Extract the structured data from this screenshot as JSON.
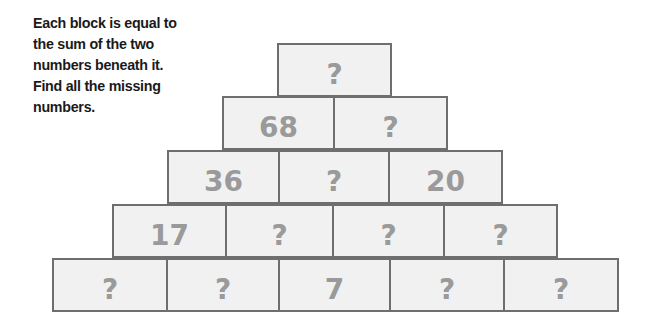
{
  "instructions": "Each block is equal to the sum of the two numbers beneath it. Find all the missing numbers.",
  "pyramid": {
    "rows": [
      [
        "?"
      ],
      [
        "68",
        "?"
      ],
      [
        "36",
        "?",
        "20"
      ],
      [
        "17",
        "?",
        "?",
        "?"
      ],
      [
        "?",
        "?",
        "7",
        "?",
        "?"
      ]
    ]
  },
  "colors": {
    "block_fill": "#f1f1f1",
    "block_border": "#6e6e6e",
    "number_text": "#9a9a9a",
    "instruction_text": "#1a1a1a"
  }
}
